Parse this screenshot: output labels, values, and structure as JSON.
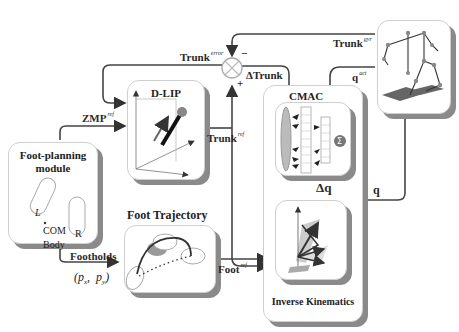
{
  "blocks": {
    "foot_planning": {
      "title_line1": "Foot-planning",
      "title_line2": "module",
      "left_foot": "L",
      "right_foot": "R",
      "com": "COM",
      "body": "Body"
    },
    "dlip": {
      "title": "D-LIP"
    },
    "foot_trajectory": {
      "title": "Foot Trajectory"
    },
    "cmac": {
      "title": "CMAC",
      "sum_symbol": "Σ"
    },
    "inverse_kinematics": {
      "title": "Inverse Kinematics"
    },
    "robot": {
      "title": ""
    }
  },
  "signals": {
    "zmp_ref": {
      "base": "ZMP",
      "sup": "ref"
    },
    "trunk_ref": {
      "base": "Trunk",
      "sup": "ref"
    },
    "trunk_error": {
      "base": "Trunk",
      "sup": "error"
    },
    "delta_trunk": {
      "base": "ΔTrunk"
    },
    "trunk_gyr": {
      "base": "Trunk",
      "sup": "gyr"
    },
    "q_act": {
      "base": "q",
      "sup": "act"
    },
    "delta_q": {
      "base": "Δq"
    },
    "q": {
      "base": "q"
    },
    "foot_ref": {
      "base": "Foot",
      "sup": "ref"
    },
    "footholds": {
      "base": "Footholds"
    },
    "footholds_coords": "(p_x,  p_y)",
    "footholds_px": "p",
    "footholds_px_sub": "x",
    "footholds_py": "p",
    "footholds_py_sub": "y"
  },
  "summing_junction": {
    "minus": "−",
    "plus": "+"
  },
  "colors": {
    "line": "#444444",
    "shadow": "#8a8a8a",
    "box_border": "#cfcfcf",
    "fill_gray": "#b8b8b8"
  }
}
